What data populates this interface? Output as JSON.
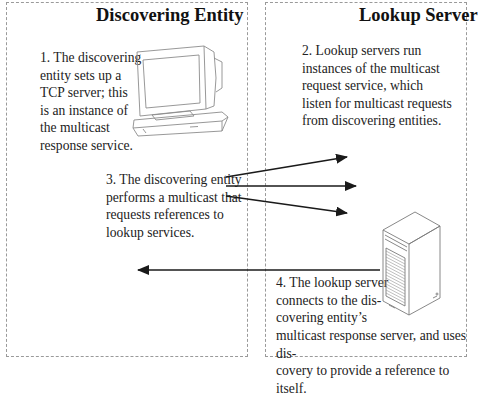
{
  "panels": {
    "left": {
      "title": "Discovering Entity"
    },
    "right": {
      "title": "Lookup Server"
    }
  },
  "steps": [
    {
      "number": 1,
      "text": "1. The discovering\nentity sets up a\nTCP server; this\nis an instance of\nthe multicast\nresponse service."
    },
    {
      "number": 2,
      "text": "2. Lookup servers run\ninstances of the multicast\nrequest service, which\nlisten for multicast requests\nfrom discovering entities."
    },
    {
      "number": 3,
      "text": "3. The discovering entity\nperforms a multicast that\nrequests references to\nlookup services."
    },
    {
      "number": 4,
      "text_top": "4. The lookup server\nconnects to the dis-\ncovering entity’s",
      "text_bottom": "multicast response server, and uses dis-\ncovery to provide a reference to itself."
    }
  ],
  "icons": {
    "computer": "desktop-computer-icon",
    "server": "tower-server-icon"
  },
  "arrows": {
    "multicast_count": 3,
    "response_direction": "right-to-left"
  },
  "colors": {
    "border": "#9a9a9a",
    "arrow": "#1a1a1a",
    "icon_line": "#8c8c8c"
  }
}
